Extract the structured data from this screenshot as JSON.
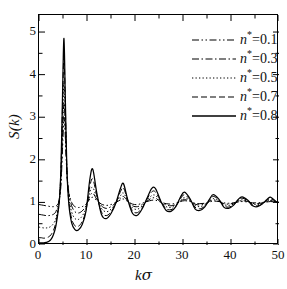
{
  "chart_data": {
    "type": "line",
    "title": "",
    "xlabel": "kσ",
    "ylabel": "S(k)",
    "xlim": [
      0,
      50
    ],
    "ylim": [
      0,
      5.4
    ],
    "xticks": [
      0,
      10,
      20,
      30,
      40,
      50
    ],
    "yticks": [
      0,
      1,
      2,
      3,
      4,
      5
    ],
    "xtick_labels": [
      "0",
      "10",
      "20",
      "30",
      "40",
      "50"
    ],
    "ytick_labels": [
      "0",
      "1",
      "2",
      "3",
      "4",
      "5"
    ],
    "minor_ticks": true,
    "grid": false,
    "frame": "all-four-sides",
    "legend_position": "top-right",
    "series": [
      {
        "name": "n*=0.1",
        "density": 0.1,
        "linestyle": "dash-dot-dot",
        "color": "#000000",
        "s_at_zero": 0.95,
        "first_peak_k": 5.2,
        "first_peak_value": 3.0,
        "x": [
          0,
          0.5,
          1,
          1.5,
          2,
          2.5,
          3,
          3.5,
          4,
          4.3,
          4.6,
          4.9,
          5.2,
          5.5,
          5.8,
          6.2,
          6.8,
          7.5,
          8.2,
          9,
          9.8,
          10.6,
          11.2,
          12,
          13,
          14,
          15,
          16,
          17,
          17.6,
          18.5,
          19.5,
          20.5,
          21.5,
          22.5,
          23.5,
          24.3,
          25.5,
          26.5,
          27.5,
          28.5,
          29.5,
          30.3,
          31.5,
          32.5,
          33.5,
          34.5,
          35.5,
          36.3,
          37.5,
          38.5,
          39.5,
          40.5,
          41.5,
          42.3,
          43.5,
          44.5,
          45.5,
          46.5,
          47.5,
          48.3,
          49.5,
          50
        ],
        "y": [
          0.95,
          0.94,
          0.93,
          0.92,
          0.91,
          0.9,
          0.9,
          0.91,
          0.97,
          1.1,
          1.45,
          2.25,
          3.0,
          2.5,
          1.7,
          1.25,
          1.0,
          0.9,
          0.88,
          0.9,
          0.96,
          1.08,
          1.12,
          1.05,
          0.96,
          0.93,
          0.95,
          1.0,
          1.06,
          1.08,
          1.02,
          0.96,
          0.95,
          0.98,
          1.02,
          1.05,
          1.05,
          1.0,
          0.97,
          0.96,
          0.98,
          1.02,
          1.04,
          1.02,
          0.98,
          0.97,
          0.98,
          1.01,
          1.03,
          1.02,
          0.99,
          0.98,
          0.99,
          1.01,
          1.02,
          1.01,
          0.99,
          0.99,
          1.0,
          1.01,
          1.02,
          1.0,
          1.0
        ]
      },
      {
        "name": "n*=0.3",
        "density": 0.3,
        "linestyle": "dash-dot",
        "color": "#000000",
        "s_at_zero": 0.72,
        "first_peak_k": 5.2,
        "first_peak_value": 3.35,
        "x": [
          0,
          0.5,
          1,
          1.5,
          2,
          2.5,
          3,
          3.5,
          4,
          4.3,
          4.6,
          4.9,
          5.2,
          5.5,
          5.8,
          6.2,
          6.8,
          7.5,
          8.2,
          9,
          9.8,
          10.6,
          11.2,
          12,
          13,
          14,
          15,
          16,
          17,
          17.6,
          18.5,
          19.5,
          20.5,
          21.5,
          22.5,
          23.5,
          24.3,
          25.5,
          26.5,
          27.5,
          28.5,
          29.5,
          30.3,
          31.5,
          32.5,
          33.5,
          34.5,
          35.5,
          36.3,
          37.5,
          38.5,
          39.5,
          40.5,
          41.5,
          42.3,
          43.5,
          44.5,
          45.5,
          46.5,
          47.5,
          48.3,
          49.5,
          50
        ],
        "y": [
          0.72,
          0.71,
          0.7,
          0.69,
          0.69,
          0.7,
          0.72,
          0.78,
          0.95,
          1.15,
          1.6,
          2.55,
          3.35,
          2.7,
          1.75,
          1.22,
          0.92,
          0.78,
          0.75,
          0.8,
          0.92,
          1.15,
          1.22,
          1.08,
          0.92,
          0.86,
          0.9,
          0.99,
          1.1,
          1.14,
          1.03,
          0.92,
          0.9,
          0.95,
          1.03,
          1.1,
          1.1,
          1.0,
          0.94,
          0.92,
          0.95,
          1.03,
          1.07,
          1.03,
          0.96,
          0.94,
          0.96,
          1.02,
          1.06,
          1.03,
          0.97,
          0.96,
          0.98,
          1.02,
          1.04,
          1.02,
          0.98,
          0.97,
          0.99,
          1.02,
          1.04,
          1.01,
          1.0
        ]
      },
      {
        "name": "n*=0.5",
        "density": 0.5,
        "linestyle": "dotted",
        "color": "#000000",
        "s_at_zero": 0.42,
        "first_peak_k": 5.2,
        "first_peak_value": 3.8,
        "x": [
          0,
          0.5,
          1,
          1.5,
          2,
          2.5,
          3,
          3.5,
          4,
          4.3,
          4.6,
          4.9,
          5.2,
          5.5,
          5.8,
          6.2,
          6.8,
          7.5,
          8.2,
          9,
          9.8,
          10.6,
          11.2,
          12,
          13,
          14,
          15,
          16,
          17,
          17.6,
          18.5,
          19.5,
          20.5,
          21.5,
          22.5,
          23.5,
          24.3,
          25.5,
          26.5,
          27.5,
          28.5,
          29.5,
          30.3,
          31.5,
          32.5,
          33.5,
          34.5,
          35.5,
          36.3,
          37.5,
          38.5,
          39.5,
          40.5,
          41.5,
          42.3,
          43.5,
          44.5,
          45.5,
          46.5,
          47.5,
          48.3,
          49.5,
          50
        ],
        "y": [
          0.42,
          0.41,
          0.4,
          0.4,
          0.41,
          0.44,
          0.5,
          0.62,
          0.88,
          1.15,
          1.72,
          2.85,
          3.8,
          2.95,
          1.8,
          1.15,
          0.78,
          0.62,
          0.6,
          0.68,
          0.88,
          1.25,
          1.35,
          1.12,
          0.86,
          0.78,
          0.84,
          0.98,
          1.16,
          1.22,
          1.04,
          0.87,
          0.84,
          0.92,
          1.05,
          1.16,
          1.16,
          1.0,
          0.9,
          0.88,
          0.93,
          1.05,
          1.11,
          1.04,
          0.93,
          0.9,
          0.94,
          1.03,
          1.09,
          1.04,
          0.95,
          0.93,
          0.96,
          1.03,
          1.06,
          1.03,
          0.96,
          0.95,
          0.98,
          1.03,
          1.06,
          1.01,
          1.0
        ]
      },
      {
        "name": "n*=0.7",
        "density": 0.7,
        "linestyle": "dashed",
        "color": "#000000",
        "s_at_zero": 0.17,
        "first_peak_k": 5.2,
        "first_peak_value": 4.45,
        "x": [
          0,
          0.5,
          1,
          1.5,
          2,
          2.5,
          3,
          3.5,
          4,
          4.3,
          4.6,
          4.9,
          5.2,
          5.5,
          5.8,
          6.2,
          6.8,
          7.5,
          8.2,
          9,
          9.8,
          10.6,
          11.2,
          12,
          13,
          14,
          15,
          16,
          17,
          17.6,
          18.5,
          19.5,
          20.5,
          21.5,
          22.5,
          23.5,
          24.3,
          25.5,
          26.5,
          27.5,
          28.5,
          29.5,
          30.3,
          31.5,
          32.5,
          33.5,
          34.5,
          35.5,
          36.3,
          37.5,
          38.5,
          39.5,
          40.5,
          41.5,
          42.3,
          43.5,
          44.5,
          45.5,
          46.5,
          47.5,
          48.3,
          49.5,
          50
        ],
        "y": [
          0.17,
          0.17,
          0.16,
          0.17,
          0.19,
          0.24,
          0.34,
          0.52,
          0.84,
          1.14,
          1.85,
          3.25,
          4.45,
          3.2,
          1.82,
          1.05,
          0.62,
          0.45,
          0.44,
          0.55,
          0.82,
          1.38,
          1.55,
          1.18,
          0.78,
          0.69,
          0.78,
          0.98,
          1.26,
          1.34,
          1.05,
          0.8,
          0.76,
          0.88,
          1.08,
          1.25,
          1.24,
          1.0,
          0.85,
          0.83,
          0.91,
          1.09,
          1.18,
          1.06,
          0.89,
          0.85,
          0.91,
          1.05,
          1.14,
          1.06,
          0.92,
          0.89,
          0.94,
          1.05,
          1.1,
          1.04,
          0.94,
          0.92,
          0.96,
          1.05,
          1.09,
          1.01,
          1.0
        ]
      },
      {
        "name": "n*=0.8",
        "density": 0.8,
        "linestyle": "solid",
        "color": "#000000",
        "s_at_zero": 0.05,
        "first_peak_k": 5.2,
        "first_peak_value": 4.85,
        "x": [
          0,
          0.5,
          1,
          1.5,
          2,
          2.5,
          3,
          3.5,
          4,
          4.3,
          4.6,
          4.9,
          5.2,
          5.5,
          5.8,
          6.2,
          6.8,
          7.5,
          8.2,
          9,
          9.8,
          10.6,
          11.2,
          12,
          13,
          14,
          15,
          16,
          17,
          17.6,
          18.5,
          19.5,
          20.5,
          21.5,
          22.5,
          23.5,
          24.3,
          25.5,
          26.5,
          27.5,
          28.5,
          29.5,
          30.3,
          31.5,
          32.5,
          33.5,
          34.5,
          35.5,
          36.3,
          37.5,
          38.5,
          39.5,
          40.5,
          41.5,
          42.3,
          43.5,
          44.5,
          45.5,
          46.5,
          47.5,
          48.3,
          49.5,
          50
        ],
        "y": [
          0.05,
          0.05,
          0.05,
          0.06,
          0.08,
          0.13,
          0.24,
          0.44,
          0.8,
          1.12,
          1.92,
          3.5,
          4.85,
          3.35,
          1.82,
          0.98,
          0.52,
          0.36,
          0.35,
          0.48,
          0.8,
          1.55,
          1.78,
          1.25,
          0.72,
          0.62,
          0.74,
          0.98,
          1.34,
          1.44,
          1.06,
          0.74,
          0.7,
          0.85,
          1.1,
          1.33,
          1.32,
          1.0,
          0.81,
          0.79,
          0.9,
          1.13,
          1.24,
          1.08,
          0.85,
          0.81,
          0.89,
          1.07,
          1.18,
          1.07,
          0.89,
          0.86,
          0.93,
          1.07,
          1.13,
          1.05,
          0.92,
          0.9,
          0.96,
          1.07,
          1.12,
          1.01,
          1.0
        ]
      }
    ],
    "legend_entries": [
      {
        "symbol": "n",
        "sup": "*",
        "eq": "=0.1",
        "linestyle": "dash-dot-dot"
      },
      {
        "symbol": "n",
        "sup": "*",
        "eq": "=0.3",
        "linestyle": "dash-dot"
      },
      {
        "symbol": "n",
        "sup": "*",
        "eq": "=0.5",
        "linestyle": "dotted"
      },
      {
        "symbol": "n",
        "sup": "*",
        "eq": "=0.7",
        "linestyle": "dashed"
      },
      {
        "symbol": "n",
        "sup": "*",
        "eq": "=0.8",
        "linestyle": "solid"
      }
    ]
  },
  "axis": {
    "y_title": "S(k)",
    "x_title_k": "k",
    "x_title_sigma": "σ"
  }
}
